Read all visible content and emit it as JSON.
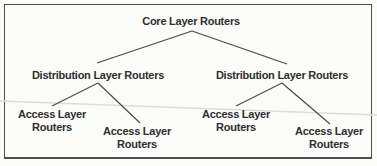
{
  "figure": {
    "background": "#fbfbf9",
    "border_color": "#4d4d4d",
    "line_color": "#4a4a4a",
    "text_color": "#2f2f2f",
    "artifact_line_color": "#dcdcd7"
  },
  "nodes": {
    "core": {
      "label": "Core Layer Routers"
    },
    "distribution_left": {
      "label": "Distribution Layer Routers"
    },
    "distribution_right": {
      "label": "Distribution Layer Routers"
    },
    "access_far_left": {
      "line1": "Access Layer",
      "line2": "Routers"
    },
    "access_mid_left": {
      "line1": "Access Layer",
      "line2": "Routers"
    },
    "access_mid_right": {
      "line1": "Access Layer",
      "line2": "Routers"
    },
    "access_far_right": {
      "line1": "Access Layer",
      "line2": "Routers"
    }
  },
  "edges": [
    {
      "from": "core",
      "to": "distribution_left"
    },
    {
      "from": "core",
      "to": "distribution_right"
    },
    {
      "from": "distribution_left",
      "to": "access_far_left"
    },
    {
      "from": "distribution_left",
      "to": "access_mid_left"
    },
    {
      "from": "distribution_right",
      "to": "access_mid_right"
    },
    {
      "from": "distribution_right",
      "to": "access_far_right"
    }
  ]
}
